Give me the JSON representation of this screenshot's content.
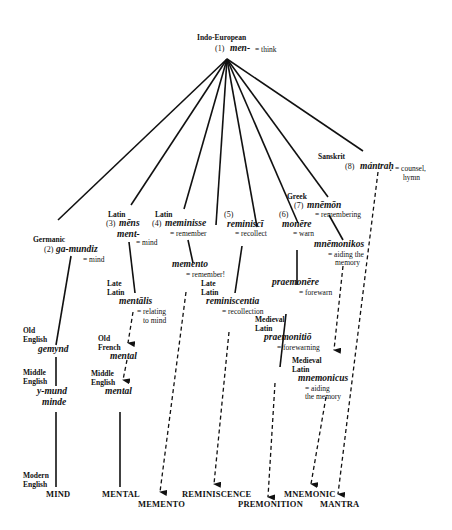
{
  "root": {
    "lang": "Indo-European",
    "num": "(1)",
    "word": "men-",
    "gloss": "= think"
  },
  "branches": {
    "germanic": {
      "lang": "Germanic",
      "num": "(2)",
      "word": "ga-mundiz",
      "gloss": "= mind",
      "old_english": {
        "lang1": "Old",
        "lang2": "English",
        "word": "gemynd"
      },
      "middle_english": {
        "lang1": "Middle",
        "lang2": "English",
        "word1": "y-mund",
        "word2": "minde"
      },
      "modern": {
        "lang1": "Modern",
        "lang2": "English",
        "word": "MIND"
      }
    },
    "latin_mens": {
      "lang": "Latin",
      "num": "(3)",
      "word1": "mēns",
      "word2": "ment-",
      "gloss": "= mind",
      "late_latin": {
        "lang1": "Late",
        "lang2": "Latin",
        "word": "mentālis",
        "gloss1": "= relating",
        "gloss2": "to mind"
      },
      "old_french": {
        "lang1": "Old",
        "lang2": "French",
        "word": "mental"
      },
      "middle_english": {
        "lang1": "Middle",
        "lang2": "English",
        "word": "mental"
      },
      "modern": "MENTAL"
    },
    "latin_meminisse": {
      "lang": "Latin",
      "num": "(4)",
      "word": "meminisse",
      "gloss": "= remember",
      "child": {
        "word": "memento",
        "gloss": "= remember!"
      },
      "modern": "MEMENTO"
    },
    "reminisci": {
      "num": "(5)",
      "word": "reminiscī",
      "gloss": "= recollect",
      "late_latin": {
        "lang1": "Late",
        "lang2": "Latin",
        "word": "reminiscentia",
        "gloss": "= recollection"
      },
      "modern": "REMINISCENCE"
    },
    "monere": {
      "num": "(6)",
      "word": "monēre",
      "gloss": "= warn",
      "child": {
        "word": "praemonēre",
        "gloss": "= forewarn"
      },
      "medieval": {
        "lang1": "Medieval",
        "lang2": "Latin",
        "word": "praemonitiō",
        "gloss": "= forewarning"
      },
      "modern": "PREMONITION"
    },
    "greek": {
      "lang": "Greek",
      "num": "(7)",
      "word": "mnēmōn",
      "gloss": "= remembering",
      "child": {
        "word": "mnēmonikos",
        "gloss1": "= aiding the",
        "gloss2": "memory"
      },
      "medieval": {
        "lang1": "Medieval",
        "lang2": "Latin",
        "word": "mnemonicus",
        "gloss1": "= aiding",
        "gloss2": "the memory"
      },
      "modern": "MNEMONIC"
    },
    "sanskrit": {
      "lang": "Sanskrit",
      "num": "(8)",
      "word": "mántraḥ",
      "gloss1": "= counsel,",
      "gloss2": "hymn",
      "modern": "MANTRA"
    }
  }
}
